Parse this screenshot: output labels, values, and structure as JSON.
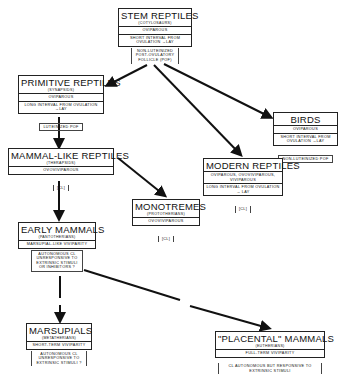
{
  "diagram": {
    "nodes": {
      "stem": {
        "title": "STEM REPTILES",
        "subtitle": "(COTYLOSAURS)",
        "rows": [
          "OVIPAROUS",
          "SHORT INTERVAL FROM OVULATION →LAY"
        ],
        "note": "NON-LUTEINIZED POST-OVULATORY FOLLICLE (POF)"
      },
      "primitive": {
        "title": "PRIMITIVE REPTILES",
        "subtitle": "(SYNAPSIDS)",
        "rows": [
          "OVIPAROUS",
          "LONG INTERVAL FROM OVULATION →LAY"
        ],
        "note": "LUTEINIZED POF"
      },
      "birds": {
        "title": "BIRDS",
        "subtitle": "",
        "rows": [
          "OVIPAROUS",
          "SHORT INTERVAL FROM OVULATION →LAY"
        ],
        "note": "NON-LUTEINIZED POF"
      },
      "mammal_like": {
        "title": "MAMMAL-LIKE REPTILES",
        "subtitle": "(THERAPSIDS)",
        "rows": [
          "OVOVIVIPAROUS"
        ],
        "note": "[CL]"
      },
      "modern": {
        "title": "MODERN REPTILES",
        "subtitle": "",
        "rows": [
          "OVIPAROUS, OVOVIVIPAROUS, VIVIPAROUS",
          "LONG INTERVAL FROM OVULATION → LAY"
        ],
        "note": "[CL]"
      },
      "monotremes": {
        "title": "MONOTREMES",
        "subtitle": "(PROTOTHERIANS)",
        "rows": [
          "OVOVIVIPAROUS"
        ],
        "note": "[CL]"
      },
      "early": {
        "title": "EARLY MAMMALS",
        "subtitle": "(PANTOTHERIANS)",
        "rows": [
          "MARSUPIAL-LIKE VIVIPARITY"
        ],
        "note": "AUTONOMOUS CL UNRESPONSIVE TO EXTRINSIC STIMULI OR INHIBITORS ?"
      },
      "marsupials": {
        "title": "MARSUPIALS",
        "subtitle": "(METATHERIANS)",
        "rows": [
          "SHORT-TERM VIVIPARITY"
        ],
        "note": "AUTONOMOUS CL UNRESPONSIVE TO EXTRINSIC STIMULI ?"
      },
      "placental": {
        "title": "\"PLACENTAL\" MAMMALS",
        "subtitle": "(EUTHERIANS)",
        "rows": [
          "FULL-TERM VIVIPARITY"
        ],
        "note": "CL AUTONOMOUS BUT RESPONSIVE TO EXTRINSIC STIMULI"
      }
    },
    "edges": [
      {
        "from": "stem",
        "to": "primitive"
      },
      {
        "from": "stem",
        "to": "modern"
      },
      {
        "from": "stem",
        "to": "birds"
      },
      {
        "from": "primitive",
        "to": "mammal_like"
      },
      {
        "from": "mammal_like",
        "to": "monotremes"
      },
      {
        "from": "mammal_like",
        "to": "early"
      },
      {
        "from": "early",
        "to": "marsupials"
      },
      {
        "from": "early",
        "to": "placental"
      }
    ],
    "colors": {
      "line": "#111111",
      "background": "#ffffff"
    }
  }
}
